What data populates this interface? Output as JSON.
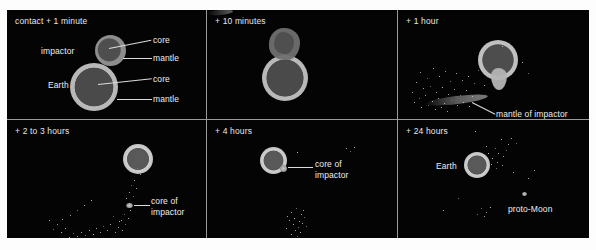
{
  "figure": {
    "name": "giant-impact-moon-formation-sequence",
    "background_color": "#ffffff",
    "panel_background_color": "#000000",
    "divider_color": "#9a9a9a",
    "text_color": "#e8e8e8",
    "rows": 2,
    "columns": 3
  },
  "panels": [
    {
      "id": "panel-1",
      "time_label": "contact + 1 minute",
      "labels": [
        {
          "name": "impactor-label",
          "text": "impactor"
        },
        {
          "name": "impactor-core-label",
          "text": "core"
        },
        {
          "name": "impactor-mantle-label",
          "text": "mantle"
        },
        {
          "name": "earth-label",
          "text": "Earth"
        },
        {
          "name": "earth-core-label",
          "text": "core"
        },
        {
          "name": "earth-mantle-label",
          "text": "mantle"
        }
      ]
    },
    {
      "id": "panel-2",
      "time_label": "+ 10 minutes",
      "labels": []
    },
    {
      "id": "panel-3",
      "time_label": "+ 1 hour",
      "labels": [
        {
          "name": "mantle-of-impactor-label",
          "text": "mantle of impactor"
        }
      ]
    },
    {
      "id": "panel-4",
      "time_label": "+ 2 to 3 hours",
      "labels": [
        {
          "name": "core-of-impactor-label",
          "text": "core of impactor"
        }
      ]
    },
    {
      "id": "panel-5",
      "time_label": "+ 4 hours",
      "labels": [
        {
          "name": "core-of-impactor-label",
          "text": "core of impactor"
        }
      ]
    },
    {
      "id": "panel-6",
      "time_label": "+ 24 hours",
      "labels": [
        {
          "name": "earth-label",
          "text": "Earth"
        },
        {
          "name": "proto-moon-label",
          "text": "proto-Moon"
        }
      ]
    }
  ],
  "colors": {
    "core": "#4a4a4a",
    "mantle": "#b9b9b9",
    "impactor_mantle": "#8e8e8e",
    "debris": "#d8d8d8"
  }
}
